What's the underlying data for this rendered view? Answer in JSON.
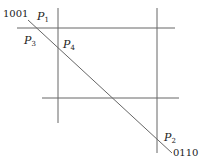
{
  "diagram": {
    "type": "line-intersection-figure",
    "stroke_color": "#666666",
    "lines": {
      "top_horizontal": {
        "x1": 17,
        "y1": 28,
        "x2": 175,
        "y2": 28
      },
      "bottom_horizontal": {
        "x1": 42,
        "y1": 98,
        "x2": 179,
        "y2": 98
      },
      "left_vertical": {
        "x1": 58,
        "y1": 8,
        "x2": 58,
        "y2": 123
      },
      "right_vertical": {
        "x1": 157,
        "y1": 8,
        "x2": 157,
        "y2": 153
      },
      "diagonal": {
        "x1": 28,
        "y1": 20,
        "x2": 172,
        "y2": 153
      }
    },
    "labels": {
      "code_start": "1001",
      "code_end": "0110",
      "p1": {
        "letter": "P",
        "sub": "1"
      },
      "p2": {
        "letter": "P",
        "sub": "2"
      },
      "p3": {
        "letter": "P",
        "sub": "3"
      },
      "p4": {
        "letter": "P",
        "sub": "4"
      }
    }
  }
}
